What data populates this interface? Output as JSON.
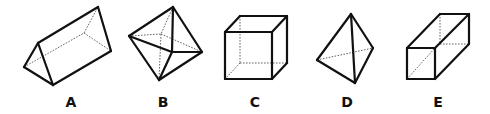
{
  "figure": {
    "shapes": [
      {
        "label": "A",
        "name": "triangular-prism",
        "label_x": 71,
        "visible_edges": [
          [
            24,
            67,
            38,
            43
          ],
          [
            38,
            43,
            53,
            85
          ],
          [
            53,
            85,
            24,
            67
          ],
          [
            38,
            43,
            98,
            7
          ],
          [
            98,
            7,
            111,
            51
          ],
          [
            111,
            51,
            53,
            85
          ]
        ],
        "hidden_edges": [
          [
            24,
            67,
            84,
            33
          ],
          [
            84,
            33,
            98,
            7
          ],
          [
            84,
            33,
            111,
            51
          ]
        ]
      },
      {
        "label": "B",
        "name": "octahedron",
        "label_x": 163,
        "visible_edges": [
          [
            173,
            7,
            129,
            36
          ],
          [
            173,
            7,
            202,
            52
          ],
          [
            173,
            7,
            172,
            52
          ],
          [
            129,
            36,
            172,
            52
          ],
          [
            172,
            52,
            202,
            52
          ],
          [
            129,
            36,
            159,
            80
          ],
          [
            202,
            52,
            159,
            80
          ],
          [
            172,
            52,
            159,
            80
          ]
        ],
        "hidden_edges": [
          [
            173,
            7,
            161,
            34
          ],
          [
            129,
            36,
            161,
            34
          ],
          [
            161,
            34,
            202,
            52
          ],
          [
            161,
            34,
            159,
            80
          ]
        ]
      },
      {
        "label": "C",
        "name": "cube",
        "label_x": 255,
        "visible_edges": [
          [
            225,
            32,
            272,
            32
          ],
          [
            272,
            32,
            272,
            79
          ],
          [
            272,
            79,
            225,
            79
          ],
          [
            225,
            79,
            225,
            32
          ],
          [
            225,
            32,
            240,
            16
          ],
          [
            240,
            16,
            287,
            16
          ],
          [
            287,
            16,
            272,
            32
          ],
          [
            287,
            16,
            287,
            63
          ],
          [
            287,
            63,
            272,
            79
          ]
        ],
        "hidden_edges": [
          [
            240,
            16,
            240,
            63
          ],
          [
            240,
            63,
            287,
            63
          ],
          [
            240,
            63,
            225,
            79
          ]
        ]
      },
      {
        "label": "D",
        "name": "tetrahedron",
        "label_x": 347,
        "visible_edges": [
          [
            351,
            14,
            317,
            60
          ],
          [
            351,
            14,
            373,
            48
          ],
          [
            351,
            14,
            355,
            83
          ],
          [
            317,
            60,
            355,
            83
          ],
          [
            373,
            48,
            355,
            83
          ]
        ],
        "hidden_edges": [
          [
            317,
            60,
            373,
            48
          ]
        ]
      },
      {
        "label": "E",
        "name": "rectangular-prism",
        "label_x": 438,
        "visible_edges": [
          [
            407,
            48,
            435,
            48
          ],
          [
            435,
            48,
            435,
            79
          ],
          [
            435,
            79,
            407,
            79
          ],
          [
            407,
            79,
            407,
            48
          ],
          [
            407,
            48,
            440,
            14
          ],
          [
            440,
            14,
            469,
            14
          ],
          [
            469,
            14,
            435,
            48
          ],
          [
            469,
            14,
            469,
            44
          ],
          [
            469,
            44,
            435,
            79
          ]
        ],
        "hidden_edges": [
          [
            440,
            14,
            440,
            44
          ],
          [
            440,
            44,
            469,
            44
          ],
          [
            407,
            79,
            435,
            48
          ]
        ]
      }
    ],
    "label_y": 107,
    "colors": {
      "edge": "#111111",
      "hidden_edge": "#666666",
      "background": "#ffffff"
    }
  },
  "labels": {
    "a": "A",
    "b": "B",
    "c": "C",
    "d": "D",
    "e": "E"
  }
}
